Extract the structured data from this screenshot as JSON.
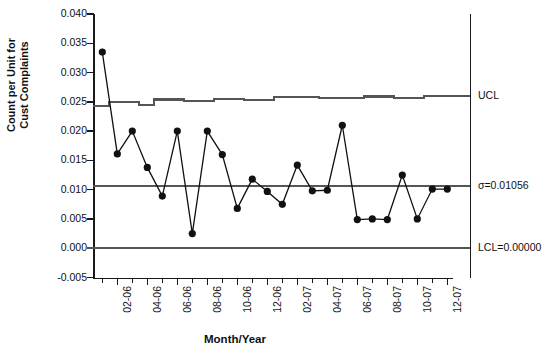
{
  "chart_data": {
    "type": "line",
    "title": "",
    "xlabel": "Month/Year",
    "ylabel": "Count per Unit for Cust Complaints",
    "ylabel_lines": [
      "Count per Unit for",
      "Cust Complaints"
    ],
    "ylim": [
      -0.005,
      0.04
    ],
    "ytick_values": [
      0.04,
      0.035,
      0.03,
      0.025,
      0.02,
      0.015,
      0.01,
      0.005,
      0.0,
      -0.005
    ],
    "ytick_labels": [
      "0.040",
      "0.035",
      "0.030",
      "0.025",
      "0.020",
      "0.015",
      "0.010",
      "0.005",
      "0.000",
      "-0.005"
    ],
    "grid": false,
    "legend": "none",
    "x": [
      "01-06",
      "02-06",
      "03-06",
      "04-06",
      "05-06",
      "06-06",
      "07-06",
      "08-06",
      "09-06",
      "10-06",
      "11-06",
      "12-06",
      "01-07",
      "02-07",
      "03-07",
      "04-07",
      "05-07",
      "06-07",
      "07-07",
      "08-07",
      "09-07",
      "10-07",
      "11-07",
      "12-07"
    ],
    "xtick_labels_shown": [
      "02-06",
      "04-06",
      "06-06",
      "08-06",
      "10-06",
      "12-06",
      "02-07",
      "04-07",
      "06-07",
      "08-07",
      "10-07",
      "12-07"
    ],
    "series": [
      {
        "name": "Count per Unit",
        "marker": "filled-circle",
        "values": [
          0.0335,
          0.0161,
          0.02,
          0.0138,
          0.0089,
          0.02,
          0.0025,
          0.02,
          0.016,
          0.0068,
          0.0118,
          0.0097,
          0.0075,
          0.0142,
          0.0098,
          0.0099,
          0.021,
          0.0049,
          0.005,
          0.0049,
          0.0125,
          0.005,
          0.0101,
          0.0101
        ]
      }
    ],
    "control_limits": {
      "ucl": {
        "label": "UCL",
        "type": "stepped",
        "values": [
          0.0243,
          0.025,
          0.025,
          0.0245,
          0.0254,
          0.0254,
          0.0252,
          0.0252,
          0.0255,
          0.0255,
          0.0253,
          0.0253,
          0.0258,
          0.0258,
          0.0258,
          0.0256,
          0.0256,
          0.0256,
          0.0259,
          0.0259,
          0.0257,
          0.0257,
          0.026,
          0.026
        ]
      },
      "center": {
        "label": "σ=0.01056",
        "value": 0.01056
      },
      "lcl": {
        "label": "LCL=0.00000",
        "value": 0.0
      }
    },
    "colors": {
      "series": "#111111",
      "limit_line": "#555555",
      "axis": "#1a1a1a",
      "background": "#ffffff"
    }
  }
}
